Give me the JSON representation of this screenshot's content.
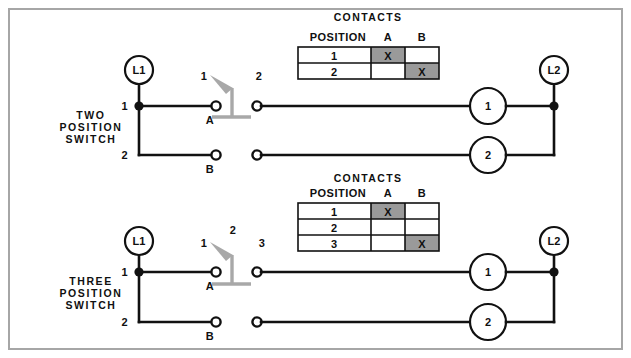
{
  "page": {
    "background_color": "#ffffff",
    "frame_color": "#a6a6a6",
    "wire_color": "#111111",
    "lever_color": "#a8a8a8",
    "contact_fill_color": "#9a9a9a"
  },
  "circuits": [
    {
      "id": "two-position",
      "side_label_lines": [
        "TWO",
        "POSITION",
        "SWITCH"
      ],
      "source_label": "L1",
      "return_label": "L2",
      "source_terminals": [
        "1",
        "2"
      ],
      "switch_terminals": [
        "A",
        "B"
      ],
      "position_markers": [
        "1",
        "2"
      ],
      "loads": [
        "1",
        "2"
      ],
      "table": {
        "position_header": "POSITION",
        "contacts_header": "CONTACTS",
        "columns": [
          "A",
          "B"
        ],
        "rows": [
          {
            "position": "1",
            "contacts": {
              "A": "X",
              "B": ""
            }
          },
          {
            "position": "2",
            "contacts": {
              "A": "",
              "B": "X"
            }
          }
        ]
      }
    },
    {
      "id": "three-position",
      "side_label_lines": [
        "THREE",
        "POSITION",
        "SWITCH"
      ],
      "source_label": "L1",
      "return_label": "L2",
      "source_terminals": [
        "1",
        "2"
      ],
      "switch_terminals": [
        "A",
        "B"
      ],
      "position_markers": [
        "1",
        "2",
        "3"
      ],
      "loads": [
        "1",
        "2"
      ],
      "table": {
        "position_header": "POSITION",
        "contacts_header": "CONTACTS",
        "columns": [
          "A",
          "B"
        ],
        "rows": [
          {
            "position": "1",
            "contacts": {
              "A": "X",
              "B": ""
            }
          },
          {
            "position": "2",
            "contacts": {
              "A": "",
              "B": ""
            }
          },
          {
            "position": "3",
            "contacts": {
              "A": "",
              "B": "X"
            }
          }
        ]
      }
    }
  ]
}
